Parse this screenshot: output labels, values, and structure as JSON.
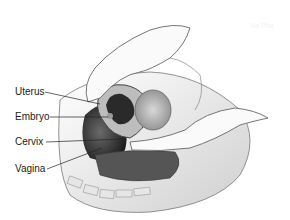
{
  "diagram": {
    "labels": [
      {
        "text": "Uterus",
        "x": 15,
        "y": 86,
        "target": [
          100,
          104
        ]
      },
      {
        "text": "Embryo",
        "x": 15,
        "y": 111,
        "target": [
          108,
          117
        ]
      },
      {
        "text": "Cervix",
        "x": 15,
        "y": 136,
        "target": [
          124,
          139
        ]
      },
      {
        "text": "Vagina",
        "x": 15,
        "y": 163,
        "target": [
          102,
          148
        ]
      }
    ],
    "watermark": "Na Pha"
  }
}
